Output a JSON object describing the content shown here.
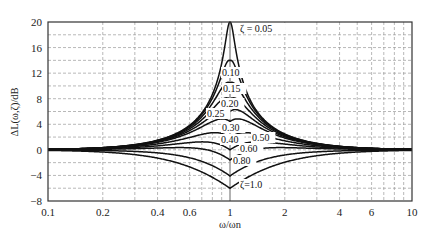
{
  "chart_data": {
    "type": "line",
    "title": "",
    "xlabel": "ω/ωn",
    "ylabel": "ΔL(ω,ζ)/dB",
    "xscale": "log",
    "xlim": [
      0.1,
      10
    ],
    "ylim": [
      -8,
      20
    ],
    "grid": true,
    "grid_style": "dashed",
    "legend": "inline curve labels",
    "xticks": [
      0.1,
      0.2,
      0.4,
      0.6,
      1,
      2,
      4,
      6,
      10
    ],
    "xtick_labels": [
      "0.1",
      "0.2",
      "0.4",
      "0.6",
      "1",
      "2",
      "4",
      "6",
      "10"
    ],
    "yticks": [
      -8,
      -4,
      0,
      4,
      8,
      12,
      16,
      20
    ],
    "ytick_labels": [
      "−8",
      "−4",
      "0",
      "4",
      "8",
      "12",
      "16",
      "20"
    ],
    "series": [
      {
        "name": "ζ=0.05",
        "zeta": 0.05,
        "peak_db": 20.0
      },
      {
        "name": "0.10",
        "zeta": 0.1,
        "peak_db": 14.0
      },
      {
        "name": "0.15",
        "zeta": 0.15,
        "peak_db": 10.5
      },
      {
        "name": "0.20",
        "zeta": 0.2,
        "peak_db": 8.0
      },
      {
        "name": "0.25",
        "zeta": 0.25,
        "peak_db": 6.0
      },
      {
        "name": "0.30",
        "zeta": 0.3,
        "peak_db": 4.4
      },
      {
        "name": "0.40",
        "zeta": 0.4,
        "peak_db": 1.9
      },
      {
        "name": "0.50",
        "zeta": 0.5,
        "peak_db": 0.0
      },
      {
        "name": "0.60",
        "zeta": 0.6,
        "peak_db": -1.6
      },
      {
        "name": "0.80",
        "zeta": 0.8,
        "peak_db": -4.1
      },
      {
        "name": "ζ=1.0",
        "zeta": 1.0,
        "peak_db": -6.0
      }
    ],
    "labels": [
      {
        "text": "ζ = 0.05",
        "x": 240,
        "y": 32
      },
      {
        "text": "0.10",
        "x": 222,
        "y": 76
      },
      {
        "text": "0.15",
        "x": 223,
        "y": 92
      },
      {
        "text": "0.20",
        "x": 221,
        "y": 107
      },
      {
        "text": "0.25",
        "x": 207,
        "y": 117
      },
      {
        "text": "0.30",
        "x": 222,
        "y": 131
      },
      {
        "text": "0.40",
        "x": 221,
        "y": 143
      },
      {
        "text": "0.50",
        "x": 252,
        "y": 141
      },
      {
        "text": "0.60",
        "x": 240,
        "y": 152
      },
      {
        "text": "0.80",
        "x": 233,
        "y": 164
      },
      {
        "text": "ζ=1.0",
        "x": 240,
        "y": 188
      }
    ]
  }
}
